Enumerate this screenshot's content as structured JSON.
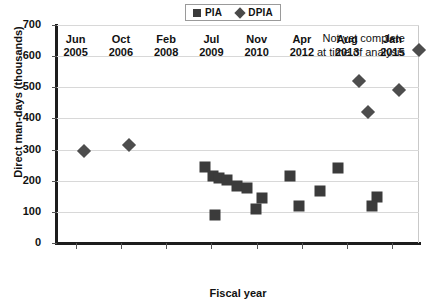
{
  "chart_data": {
    "type": "scatter",
    "title": "",
    "xlabel": "Fiscal year",
    "ylabel": "Direct man-days (thousands)",
    "ylim": [
      0,
      700
    ],
    "ytick_labels": [
      "0",
      "100",
      "200",
      "300",
      "400",
      "500",
      "600",
      "700"
    ],
    "ytick_values": [
      0,
      100,
      200,
      300,
      400,
      500,
      600,
      700
    ],
    "xtick_labels": [
      {
        "month": "Jun",
        "year": "2005"
      },
      {
        "month": "Oct",
        "year": "2006"
      },
      {
        "month": "Feb",
        "year": "2008"
      },
      {
        "month": "Jul",
        "year": "2009"
      },
      {
        "month": "Nov",
        "year": "2010"
      },
      {
        "month": "Apr",
        "year": "2012"
      },
      {
        "month": "Aug",
        "year": "2013"
      },
      {
        "month": "Jan",
        "year": "2015"
      }
    ],
    "grid": true,
    "legend_position": "top-center",
    "series": [
      {
        "name": "PIA",
        "marker": "square",
        "color": "#3b3b3b",
        "points": [
          {
            "x": 0.408,
            "y": 243
          },
          {
            "x": 0.432,
            "y": 216
          },
          {
            "x": 0.447,
            "y": 209
          },
          {
            "x": 0.47,
            "y": 203
          },
          {
            "x": 0.497,
            "y": 184
          },
          {
            "x": 0.526,
            "y": 176
          },
          {
            "x": 0.436,
            "y": 90
          },
          {
            "x": 0.566,
            "y": 146
          },
          {
            "x": 0.551,
            "y": 110
          },
          {
            "x": 0.645,
            "y": 215
          },
          {
            "x": 0.669,
            "y": 120
          },
          {
            "x": 0.727,
            "y": 166
          },
          {
            "x": 0.777,
            "y": 240
          },
          {
            "x": 0.884,
            "y": 148
          },
          {
            "x": 0.871,
            "y": 119
          }
        ]
      },
      {
        "name": "DPIA",
        "marker": "diamond",
        "color": "#4d4d4d",
        "points": [
          {
            "x": 0.074,
            "y": 297
          },
          {
            "x": 0.199,
            "y": 315
          },
          {
            "x": 0.833,
            "y": 520
          },
          {
            "x": 0.859,
            "y": 422
          },
          {
            "x": 0.944,
            "y": 492
          },
          {
            "x": 1.0,
            "y": 620
          }
        ]
      }
    ],
    "annotation": {
      "line1": "Not yet complete",
      "line2": "at time of analysis"
    }
  },
  "legend": {
    "items": [
      {
        "label": "PIA",
        "marker": "square"
      },
      {
        "label": "DPIA",
        "marker": "diamond"
      }
    ]
  }
}
